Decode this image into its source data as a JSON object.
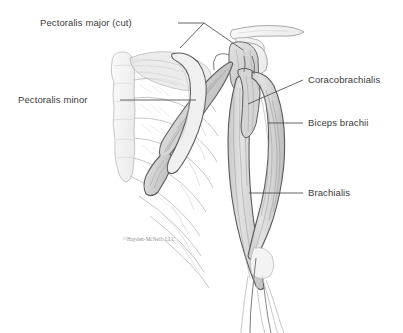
{
  "figure": {
    "kind": "anatomical-illustration",
    "background_color": "#ffffff",
    "line_color": "#4a4a4a",
    "label_color": "#3b3b3b",
    "muscle_fill": "#d8d8d8",
    "bone_fill": "#f4f4f4"
  },
  "labels": {
    "pectoralis_major": "Pectoralis major (cut)",
    "pectoralis_minor": "Pectoralis minor",
    "coracobrachialis": "Coracobrachialis",
    "biceps_brachii": "Biceps brachii",
    "brachialis": "Brachialis"
  },
  "credit": {
    "text": "©Hayden-McNeil, LLC"
  }
}
